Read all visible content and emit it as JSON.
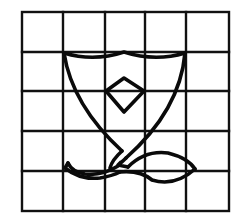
{
  "figure": {
    "grid": {
      "rows": 5,
      "columns": 5,
      "x_lines": [
        22,
        63,
        105,
        145,
        186,
        229
      ],
      "y_lines": [
        12,
        52,
        91,
        131,
        171,
        211
      ],
      "line_color": "#111111"
    },
    "shapes": [
      {
        "name": "shield-outline",
        "color": "#0a0a0a"
      },
      {
        "name": "diamond",
        "color": "#0a0a0a",
        "points": [
          [
            124,
            78
          ],
          [
            144,
            91
          ],
          [
            124,
            112
          ],
          [
            106,
            91
          ]
        ]
      },
      {
        "name": "stem-and-left-leaf",
        "color": "#0a0a0a"
      },
      {
        "name": "right-leaf",
        "color": "#0a0a0a"
      }
    ],
    "background_color": "#ffffff"
  }
}
